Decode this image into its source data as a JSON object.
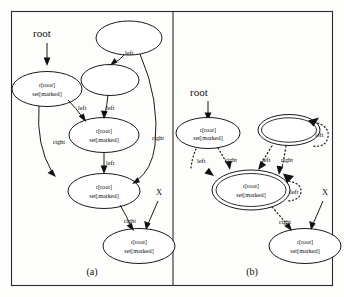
{
  "figure": {
    "background": "#fdfdfb",
    "ink_color": "#1a1a1a",
    "panels": [
      {
        "id": "a",
        "caption": "(a)",
        "entry_label": "root",
        "extra_label": "X",
        "nodes": [
          {
            "id": "a-n1",
            "line1": "",
            "line2": "",
            "double": false
          },
          {
            "id": "a-n2",
            "line1": "r[root]",
            "line2": "set[marked]",
            "double": false
          },
          {
            "id": "a-n3",
            "line1": "",
            "line2": "",
            "double": false
          },
          {
            "id": "a-n4",
            "line1": "r[root]",
            "line2": "set[marked]",
            "double": false
          },
          {
            "id": "a-n5",
            "line1": "r[root]",
            "line2": "set[marked]",
            "double": false
          },
          {
            "id": "a-n6",
            "line1": "r[root]",
            "line2": "set[marked]",
            "double": false
          }
        ],
        "edges": [
          {
            "from": "a-n1",
            "to": "a-n3",
            "label": "left"
          },
          {
            "from": "a-n1",
            "to": "a-n5",
            "label": "right"
          },
          {
            "from": "a-n2",
            "to": "a-n4",
            "label": "left"
          },
          {
            "from": "a-n2",
            "to": "a-n5",
            "label": "right"
          },
          {
            "from": "a-n3",
            "to": "a-n4",
            "label": "left"
          },
          {
            "from": "a-n4",
            "to": "a-n5",
            "label": "left"
          },
          {
            "from": "a-n5",
            "to": "a-n6",
            "label": "right"
          }
        ]
      },
      {
        "id": "b",
        "caption": "(b)",
        "entry_label": "root",
        "extra_label": "X",
        "nodes": [
          {
            "id": "b-n1",
            "line1": "r[root]",
            "line2": "set[marked]",
            "double": false
          },
          {
            "id": "b-n2",
            "line1": "",
            "line2": "",
            "double": true
          },
          {
            "id": "b-n3",
            "line1": "r[root]",
            "line2": "set[marked]",
            "double": true
          },
          {
            "id": "b-n4",
            "line1": "r[root]",
            "line2": "set[marked]",
            "double": false
          }
        ],
        "edges": [
          {
            "from": "b-n2",
            "to": "b-n2",
            "label": "left"
          },
          {
            "from": "b-n1",
            "to": "b-n3",
            "label": "left"
          },
          {
            "from": "b-n1",
            "to": "b-n3",
            "label": "right"
          },
          {
            "from": "b-n2",
            "to": "b-n3",
            "label": "left"
          },
          {
            "from": "b-n2",
            "to": "b-n3",
            "label": "right"
          },
          {
            "from": "b-n3",
            "to": "b-n3",
            "label": "left"
          },
          {
            "from": "b-n3",
            "to": "b-n4",
            "label": "right"
          }
        ]
      }
    ]
  },
  "text": {
    "root": "root",
    "x": "X",
    "left": "left",
    "right": "right",
    "node_line1": "r[root]",
    "node_line2": "set[marked]",
    "caption_a": "(a)",
    "caption_b": "(b)"
  }
}
